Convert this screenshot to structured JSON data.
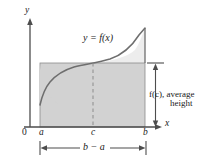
{
  "figure": {
    "background_color": "#ffffff",
    "axes": {
      "y_axis_label": "y",
      "x_axis_label": "x",
      "origin_label": "0",
      "axis_color": "#4d4d4d"
    },
    "curve": {
      "label": "y = f(x)",
      "color": "#6e6e6e",
      "shape": "increasing concave-down then upturning near b"
    },
    "rectangle": {
      "fill_color": "#d2d2d2",
      "edge_color": "#808080",
      "description": "average-value rectangle of width b minus a and height f(c)"
    },
    "region_under_curve": {
      "fill_color": "#ededed"
    },
    "dashed_line": {
      "at": "c",
      "color": "#8c8c8c",
      "style": "dashed"
    },
    "tick_labels": {
      "a": "a",
      "c": "c",
      "b": "b"
    },
    "annotations": {
      "height_line1": "f(c), average",
      "height_line2": "height",
      "width_label": "b − a"
    }
  }
}
